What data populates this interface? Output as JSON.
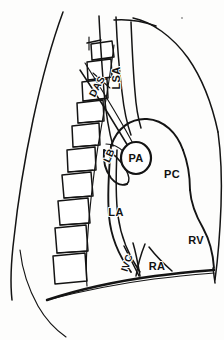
{
  "figure": {
    "view": "lateral",
    "background_color": "#fdfdfc",
    "ink_color": "#141414"
  },
  "labels": [
    {
      "id": "lsa",
      "text": "LSA",
      "full_name": "left subclavian artery",
      "x": 120,
      "y": 78,
      "rotation": -90,
      "anchor": "middle"
    },
    {
      "id": "das",
      "text": "DAS",
      "full_name": "descending aorta",
      "x": 100,
      "y": 88,
      "rotation": -62,
      "anchor": "middle"
    },
    {
      "id": "lb",
      "text": "LB",
      "full_name": "left bronchus",
      "x": 112,
      "y": 157,
      "rotation": -66,
      "anchor": "middle"
    },
    {
      "id": "pa",
      "text": "PA",
      "full_name": "pulmonary artery",
      "x": 136,
      "y": 158,
      "rotation": 0,
      "anchor": "middle"
    },
    {
      "id": "pc",
      "text": "PC",
      "full_name": "posterior cardiac border",
      "x": 172,
      "y": 174,
      "rotation": 0,
      "anchor": "middle"
    },
    {
      "id": "la",
      "text": "LA",
      "full_name": "left atrium",
      "x": 116,
      "y": 212,
      "rotation": 0,
      "anchor": "middle"
    },
    {
      "id": "rv",
      "text": "RV",
      "full_name": "right ventricle",
      "x": 196,
      "y": 240,
      "rotation": 0,
      "anchor": "middle"
    },
    {
      "id": "ivc",
      "text": "IVC",
      "full_name": "inferior vena cava",
      "x": 130,
      "y": 264,
      "rotation": -72,
      "anchor": "middle"
    },
    {
      "id": "ra",
      "text": "RA",
      "full_name": "right atrium",
      "x": 155,
      "y": 266,
      "rotation": 0,
      "anchor": "middle"
    }
  ],
  "structures": [
    {
      "id": "anterior-chest-wall",
      "name": "anterior chest wall outline"
    },
    {
      "id": "posterior-chest-wall",
      "name": "posterior chest wall outline"
    },
    {
      "id": "vertebral-column",
      "name": "thoracic vertebral column",
      "vertebra_count": 9
    },
    {
      "id": "diaphragm",
      "name": "diaphragm"
    },
    {
      "id": "cardiac-silhouette",
      "name": "cardiac silhouette"
    },
    {
      "id": "aortic-arch",
      "name": "aortic arch"
    },
    {
      "id": "great-vessel-lines",
      "name": "great vessel tramlines"
    },
    {
      "id": "pa-oval",
      "name": "pulmonary artery oval"
    }
  ]
}
